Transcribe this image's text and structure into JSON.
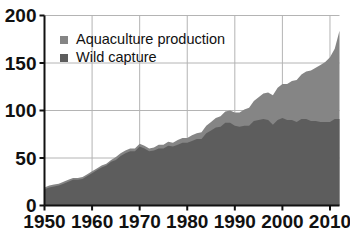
{
  "chart_data": {
    "type": "area",
    "stacked": true,
    "title": "",
    "subtitle": "",
    "xlabel": "",
    "ylabel": "",
    "xlim": [
      1950,
      2012
    ],
    "ylim": [
      0,
      200
    ],
    "grid": true,
    "legend_position": "top-left",
    "x_ticks": [
      1950,
      1960,
      1970,
      1980,
      1990,
      2000,
      2010
    ],
    "y_ticks": [
      0,
      50,
      100,
      150,
      200
    ],
    "x_tick_labels": [
      "1950",
      "1960",
      "1970",
      "1980",
      "1990",
      "2000",
      "2010"
    ],
    "y_tick_labels": [
      "0",
      "50",
      "100",
      "150",
      "200"
    ],
    "x": [
      1950,
      1951,
      1952,
      1953,
      1954,
      1955,
      1956,
      1957,
      1958,
      1959,
      1960,
      1961,
      1962,
      1963,
      1964,
      1965,
      1966,
      1967,
      1968,
      1969,
      1970,
      1971,
      1972,
      1973,
      1974,
      1975,
      1976,
      1977,
      1978,
      1979,
      1980,
      1981,
      1982,
      1983,
      1984,
      1985,
      1986,
      1987,
      1988,
      1989,
      1990,
      1991,
      1992,
      1993,
      1994,
      1995,
      1996,
      1997,
      1998,
      1999,
      2000,
      2001,
      2002,
      2003,
      2004,
      2005,
      2006,
      2007,
      2008,
      2009,
      2010,
      2011,
      2012
    ],
    "series": [
      {
        "name": "Wild capture",
        "color": "#5d5d5d",
        "values": [
          17,
          19,
          20,
          21,
          23,
          25,
          27,
          27,
          28,
          31,
          34,
          37,
          40,
          42,
          46,
          48,
          52,
          55,
          57,
          57,
          62,
          60,
          57,
          58,
          60,
          60,
          63,
          62,
          64,
          66,
          66,
          68,
          70,
          70,
          76,
          79,
          82,
          83,
          87,
          87,
          84,
          83,
          84,
          84,
          89,
          90,
          91,
          90,
          85,
          90,
          92,
          90,
          90,
          88,
          91,
          91,
          89,
          89,
          88,
          88,
          88,
          91,
          91
        ]
      },
      {
        "name": "Aquaculture production",
        "color": "#858585",
        "values": [
          2,
          2,
          2,
          2,
          2,
          2,
          2,
          2,
          2,
          2,
          2,
          2,
          2,
          2,
          2,
          3,
          3,
          3,
          3,
          3,
          3,
          3,
          3,
          3,
          4,
          4,
          4,
          4,
          5,
          5,
          5,
          6,
          6,
          7,
          8,
          9,
          10,
          11,
          12,
          13,
          14,
          15,
          17,
          19,
          21,
          24,
          27,
          29,
          31,
          34,
          36,
          38,
          41,
          44,
          47,
          50,
          53,
          56,
          60,
          63,
          68,
          74,
          93
        ]
      }
    ],
    "totals": [
      19,
      21,
      22,
      23,
      25,
      27,
      29,
      29,
      30,
      33,
      36,
      39,
      42,
      44,
      48,
      51,
      55,
      58,
      60,
      60,
      65,
      63,
      60,
      61,
      64,
      64,
      67,
      66,
      69,
      71,
      71,
      74,
      76,
      77,
      84,
      88,
      92,
      94,
      99,
      100,
      98,
      98,
      101,
      103,
      110,
      114,
      118,
      119,
      116,
      124,
      128,
      128,
      131,
      132,
      138,
      141,
      142,
      145,
      148,
      151,
      156,
      165,
      184
    ]
  },
  "legend": {
    "items": [
      {
        "label": "Aquaculture production",
        "color": "#858585"
      },
      {
        "label": "Wild capture",
        "color": "#5d5d5d"
      }
    ]
  },
  "axes": {
    "y_labels": [
      "200",
      "150",
      "100",
      "50",
      "0"
    ],
    "x_labels": [
      "1950",
      "1960",
      "1970",
      "1980",
      "1990",
      "2000",
      "2010"
    ]
  }
}
